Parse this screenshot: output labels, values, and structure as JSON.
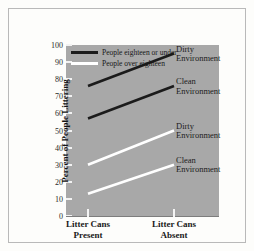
{
  "chart_data": {
    "type": "line",
    "title": "",
    "xlabel": "",
    "ylabel": "Percent of People Littering",
    "categories": [
      "Litter Cans Present",
      "Litter Cans Absent"
    ],
    "x": [
      0,
      1
    ],
    "ylim": [
      0,
      100
    ],
    "yticks": [
      0,
      10,
      20,
      30,
      40,
      50,
      60,
      70,
      80,
      90,
      100
    ],
    "ytick_labels": [
      "0",
      "10",
      "20",
      "30",
      "40",
      "50",
      "60",
      "70",
      "80",
      "90",
      "100"
    ],
    "grid": false,
    "legend_position": "top-left",
    "series": [
      {
        "name": "People eighteen or under — Dirty Environment",
        "group": "People eighteen or under",
        "environment": "Dirty Environment",
        "color": "#1b1b1b",
        "values": [
          76,
          95
        ]
      },
      {
        "name": "People eighteen or under — Clean Environment",
        "group": "People eighteen or under",
        "environment": "Clean Environment",
        "color": "#1b1b1b",
        "values": [
          57,
          76
        ]
      },
      {
        "name": "People over eighteen — Dirty Environment",
        "group": "People over eighteen",
        "environment": "Dirty Environment",
        "color": "#ffffff",
        "values": [
          30,
          50
        ]
      },
      {
        "name": "People over eighteen — Clean Environment",
        "group": "People over eighteen",
        "environment": "Clean Environment",
        "color": "#ffffff",
        "values": [
          13,
          30
        ]
      }
    ],
    "annotations": [
      {
        "text_line1": "Dirty",
        "text_line2": "Environment",
        "series": 0
      },
      {
        "text_line1": "Clean",
        "text_line2": "Environment",
        "series": 1
      },
      {
        "text_line1": "Dirty",
        "text_line2": "Environment",
        "series": 2
      },
      {
        "text_line1": "Clean",
        "text_line2": "Environment",
        "series": 3
      }
    ]
  },
  "legend": {
    "items": [
      {
        "label": "People eighteen or under",
        "color": "#1b1b1b"
      },
      {
        "label": "People over eighteen",
        "color": "#ffffff"
      }
    ]
  },
  "axis": {
    "y_title": "Percent of People Littering",
    "y_labels": [
      "100",
      "90",
      "80",
      "70",
      "60",
      "50",
      "40",
      "30",
      "20",
      "10",
      "0"
    ],
    "x_labels": [
      {
        "line1": "Litter Cans",
        "line2": "Present"
      },
      {
        "line1": "Litter Cans",
        "line2": "Absent"
      }
    ]
  },
  "callouts": [
    {
      "line1": "Dirty",
      "line2": "Environment"
    },
    {
      "line1": "Clean",
      "line2": "Environment"
    },
    {
      "line1": "Dirty",
      "line2": "Environment"
    },
    {
      "line1": "Clean",
      "line2": "Environment"
    }
  ],
  "colors": {
    "panel": "#a8a8a8",
    "page": "#fdfdfb",
    "frame": "#b9b9b9",
    "dark_series": "#1b1b1b",
    "light_series": "#ffffff"
  }
}
